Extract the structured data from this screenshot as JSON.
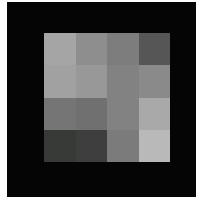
{
  "canvas": {
    "background_color": "#ffffff",
    "field_color": "#050505"
  },
  "patch_grid": {
    "rows": 4,
    "cols": 4,
    "cell_colors": [
      [
        "#a5a5a5",
        "#8e8e8e",
        "#7d7d7d",
        "#565656"
      ],
      [
        "#a1a1a1",
        "#989898",
        "#828282",
        "#8a8a8a"
      ],
      [
        "#757575",
        "#707070",
        "#828282",
        "#a9a9a9"
      ],
      [
        "#383a38",
        "#3e3e3e",
        "#7b7b7b",
        "#b9b9b9"
      ]
    ]
  }
}
